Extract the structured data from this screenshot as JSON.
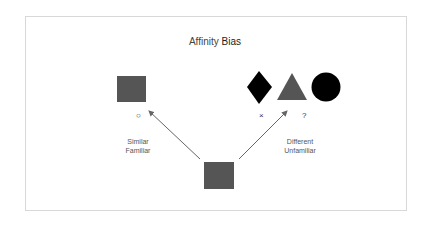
{
  "title": {
    "part1": "Affinity",
    "part2": "Bias"
  },
  "left": {
    "mark": "○",
    "line1": "Similar",
    "line2": "Familiar"
  },
  "right": {
    "mark_x": "×",
    "mark_q": "?",
    "line1": "Different",
    "line2": "Unfamiliar"
  },
  "colors": {
    "gray_shape": "#555555",
    "black_shape": "#000000",
    "arrow": "#666666",
    "border": "#d8d8d8"
  }
}
